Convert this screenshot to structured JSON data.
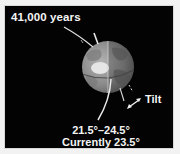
{
  "diagram": {
    "period_label": "41,000 years",
    "tilt_label": "Tilt",
    "range_label": "21.5°–24.5°",
    "current_label": "Currently 23.5°",
    "colors": {
      "background": "#030303",
      "frame_border": "#d8d8d8",
      "text": "#f4f4f4",
      "globe_lit": "#9a9a9a",
      "globe_shadow": "#5a5a5a",
      "ice_cap": "#e6e6e6"
    },
    "elements": [
      "globe",
      "rotation-axis",
      "precession-arc",
      "tilt-reference-line",
      "tilt-double-arrow"
    ]
  }
}
